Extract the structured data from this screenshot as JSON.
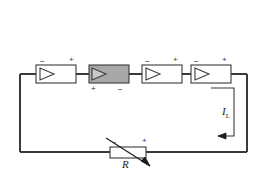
{
  "figure": {
    "type": "circuit-diagram",
    "title": "",
    "background_color": "#ffffff",
    "line_color": "#3a3a3a",
    "shade_color": "#a8a8a8",
    "width": 267,
    "height": 176
  },
  "blocks": [
    {
      "name": "amplifier-1",
      "symbol": "triangle-amplifier",
      "shaded": false,
      "terminals": {
        "left_top": "−",
        "right_top": "+"
      }
    },
    {
      "name": "amplifier-2",
      "symbol": "triangle-amplifier",
      "shaded": true,
      "terminals": {
        "left_bottom": "+",
        "right_bottom": "−"
      }
    },
    {
      "name": "amplifier-3",
      "symbol": "triangle-amplifier",
      "shaded": false,
      "terminals": {
        "left_top": "−",
        "right_top": "+"
      }
    },
    {
      "name": "amplifier-4",
      "symbol": "triangle-amplifier",
      "shaded": false,
      "terminals": {
        "left_top": "−",
        "right_top": "+"
      }
    }
  ],
  "resistor": {
    "name": "variable-resistor",
    "label": "R",
    "symbol": "rectangle-with-diagonal-arrow",
    "terminals": {
      "left_top": "−",
      "right_top": "+"
    }
  },
  "current": {
    "name": "load-current",
    "label": "I",
    "subscript": "L",
    "direction": "leftward-at-bottom"
  },
  "signs": {
    "plus": "+",
    "minus": "−"
  }
}
